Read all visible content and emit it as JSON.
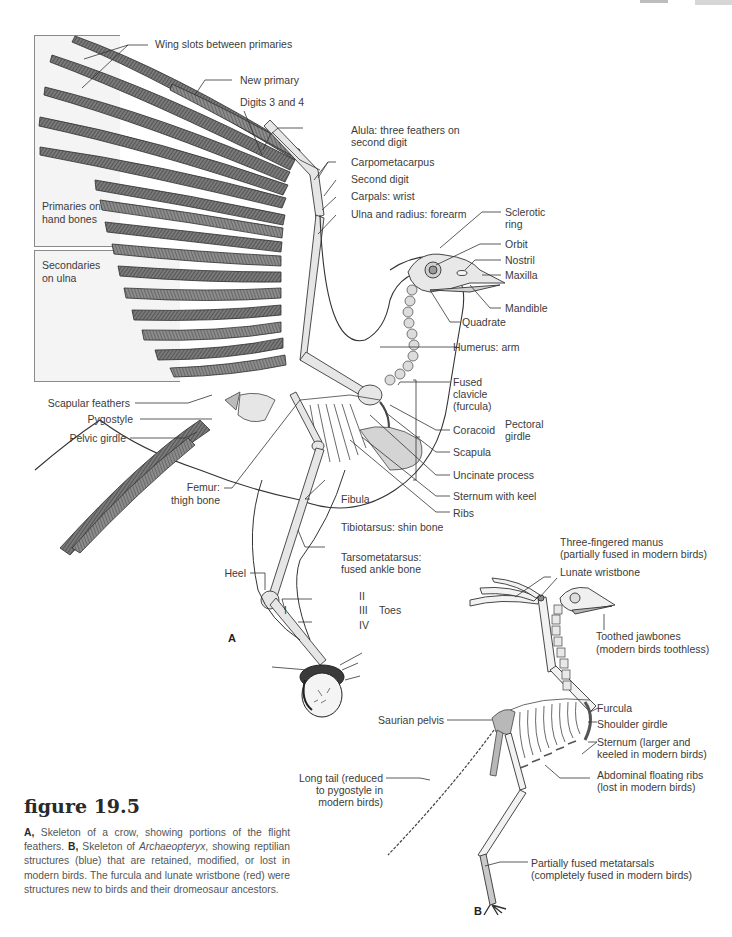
{
  "figure": {
    "number_label": "figure 19.5",
    "caption": {
      "a_marker": "A,",
      "a_text": " Skeleton of a crow, showing portions of the flight feathers. ",
      "b_marker": "B,",
      "b_text_pre": " Skeleton of ",
      "b_italic": "Archaeopteryx",
      "b_text_post": ", showing reptilian structures (blue) that are retained, modified, or lost in modern birds. The furcula and lunate wristbone (red) were structures new to birds and their dromeosaur ancestors."
    }
  },
  "panel_a": {
    "letter": "A",
    "boxes": {
      "primaries": "Primaries on\nhand bones",
      "secondaries": "Secondaries\non ulna"
    },
    "labels": {
      "wing_slots": "Wing slots between primaries",
      "new_primary": "New primary",
      "digits_3_4": "Digits 3 and 4",
      "alula_1": "Alula: three feathers on",
      "alula_2": "second digit",
      "carpometacarpus": "Carpometacarpus",
      "second_digit": "Second digit",
      "carpals": "Carpals: wrist",
      "ulna_radius": "Ulna and radius: forearm",
      "sclerotic_1": "Sclerotic",
      "sclerotic_2": "ring",
      "orbit": "Orbit",
      "nostril": "Nostril",
      "maxilla": "Maxilla",
      "mandible": "Mandible",
      "quadrate": "Quadrate",
      "humerus": "Humerus: arm",
      "fused_clavicle_1": "Fused",
      "fused_clavicle_2": "clavicle",
      "fused_clavicle_3": "(furcula)",
      "coracoid": "Coracoid",
      "scapula": "Scapula",
      "pectoral_girdle_1": "Pectoral",
      "pectoral_girdle_2": "girdle",
      "uncinate": "Uncinate process",
      "sternum_keel": "Sternum with keel",
      "ribs": "Ribs",
      "scapular_feathers": "Scapular feathers",
      "pygostyle": "Pygostyle",
      "pelvic_girdle": "Pelvic girdle",
      "femur_1": "Femur:",
      "femur_2": "thigh bone",
      "fibula": "Fibula",
      "tibiotarsus": "Tibiotarsus: shin bone",
      "heel": "Heel",
      "tarsometatarsus_1": "Tarsometatarsus:",
      "tarsometatarsus_2": "fused ankle bone",
      "toe_I": "I",
      "toe_II": "II",
      "toe_III": "III",
      "toe_IV": "IV",
      "toes": "Toes"
    }
  },
  "panel_b": {
    "letter": "B",
    "labels": {
      "manus_1": "Three-fingered manus",
      "manus_2": "(partially fused in modern birds)",
      "lunate": "Lunate wristbone",
      "toothed_1": "Toothed jawbones",
      "toothed_2": "(modern birds toothless)",
      "furcula": "Furcula",
      "shoulder": "Shoulder girdle",
      "sternum_1": "Sternum (larger and",
      "sternum_2": "keeled in modern birds)",
      "saurian": "Saurian pelvis",
      "abdominal_1": "Abdominal floating ribs",
      "abdominal_2": "(lost in modern birds)",
      "long_tail_1": "Long tail (reduced",
      "long_tail_2": "to pygostyle in",
      "long_tail_3": "modern birds)",
      "metatarsals_1": "Partially fused metatarsals",
      "metatarsals_2": "(completely fused in modern birds)"
    }
  },
  "colors": {
    "line": "#3a3a3a",
    "feather_dark": "#5a5a5a",
    "feather_mid": "#8a8a8a",
    "bone": "#e6e6e6",
    "highlight_gray": "#b8b8b8",
    "box_bg": "#f4f4f4"
  }
}
